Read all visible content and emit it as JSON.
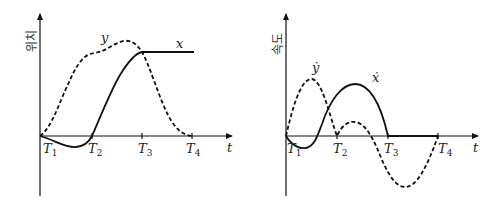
{
  "left_plot": {
    "y_axis_label": "위치",
    "x_axis_label": "t",
    "ticks": [
      {
        "label": "T",
        "sub": "1"
      },
      {
        "label": "T",
        "sub": "2"
      },
      {
        "label": "T",
        "sub": "3"
      },
      {
        "label": "T",
        "sub": "4"
      }
    ],
    "curves": [
      {
        "name": "x",
        "style": "solid",
        "label": "x"
      },
      {
        "name": "y",
        "style": "dashed",
        "label": "y"
      }
    ]
  },
  "right_plot": {
    "y_axis_label": "속도",
    "x_axis_label": "t",
    "ticks": [
      {
        "label": "T",
        "sub": "1"
      },
      {
        "label": "T",
        "sub": "2"
      },
      {
        "label": "T",
        "sub": "3"
      },
      {
        "label": "T",
        "sub": "4"
      }
    ],
    "curves": [
      {
        "name": "x-dot",
        "style": "solid",
        "label": "ẋ"
      },
      {
        "name": "y-dot",
        "style": "dashed",
        "label": "ẏ"
      }
    ]
  }
}
